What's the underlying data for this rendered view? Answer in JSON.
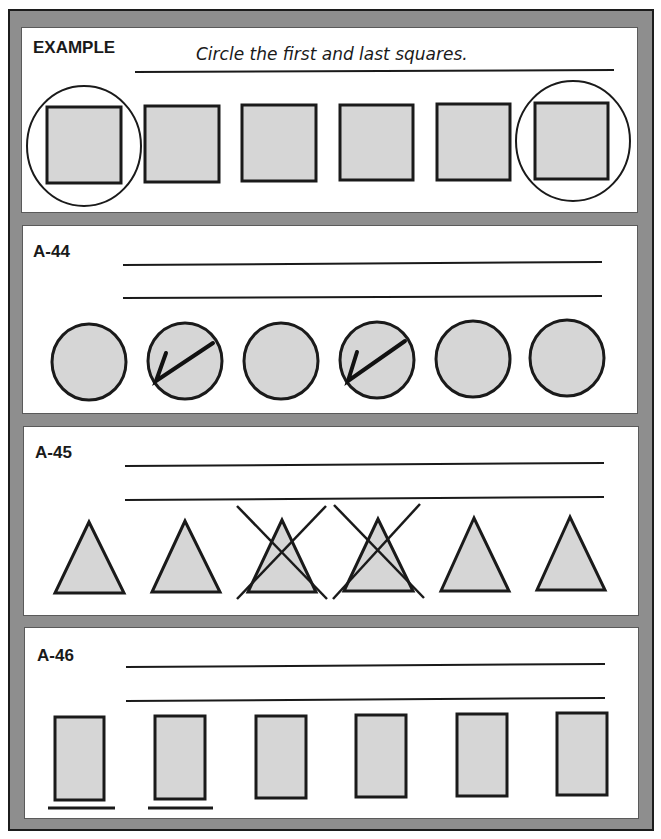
{
  "worksheet": {
    "example": {
      "label": "EXAMPLE",
      "instruction": "Circle the first and last squares.",
      "shape": "square",
      "count": 6,
      "marked": [
        1,
        6
      ],
      "mark_type": "circle"
    },
    "problems": [
      {
        "id": "A-44",
        "shape": "circle",
        "count": 6,
        "marked": [
          2,
          4
        ],
        "mark_type": "check-mark",
        "answer_lines": 2
      },
      {
        "id": "A-45",
        "shape": "triangle",
        "count": 6,
        "marked": [
          3,
          4
        ],
        "mark_type": "x-cross",
        "answer_lines": 2
      },
      {
        "id": "A-46",
        "shape": "rectangle",
        "count": 6,
        "marked": [
          1,
          2
        ],
        "mark_type": "underline",
        "answer_lines": 2
      }
    ],
    "colors": {
      "frame": "#8e8e8e",
      "frame_border": "#1c1c1c",
      "shape_fill": "#d6d6d6",
      "stroke": "#1a1a1a"
    }
  }
}
